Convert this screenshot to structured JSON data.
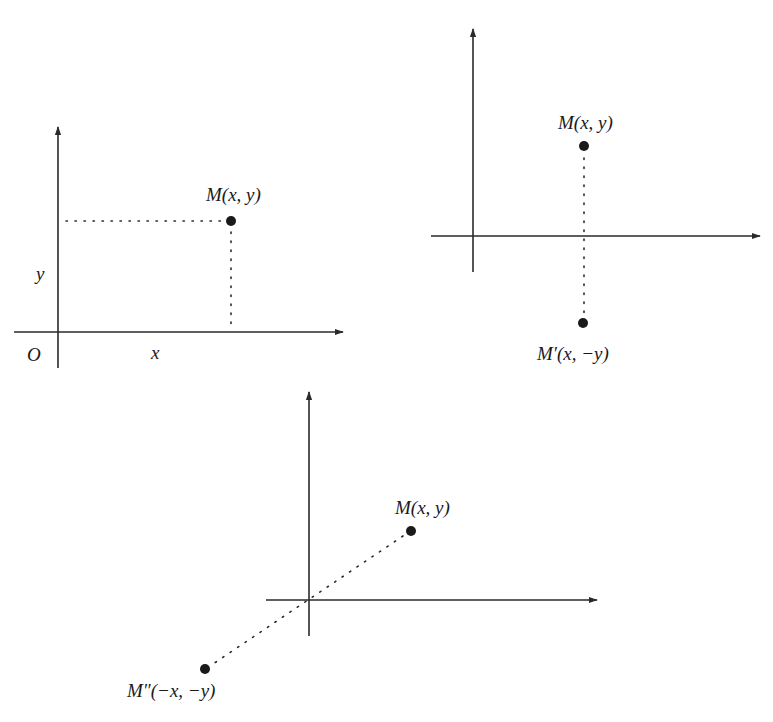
{
  "figure": {
    "colors": {
      "ink": "#1a1a1a",
      "axis": "#2a2a2a",
      "background": "#ffffff"
    }
  },
  "diagram1": {
    "title": "Coordinates of a point",
    "point_label": "M(x, y)",
    "origin_label": "O",
    "x_label": "x",
    "y_label": "y"
  },
  "diagram2": {
    "title": "Reflection across the x-axis",
    "point_label": "M(x, y)",
    "image_label": "M′(x, −y)"
  },
  "diagram3": {
    "title": "Reflection through the origin",
    "point_label": "M(x, y)",
    "image_label": "M″(−x, −y)"
  }
}
